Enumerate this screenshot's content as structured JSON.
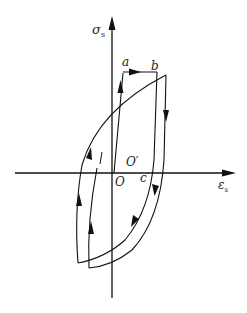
{
  "diagram": {
    "type": "stress-strain hysteresis loop",
    "axes": {
      "y_label": "σ",
      "y_sub": "s",
      "x_label": "ε",
      "x_sub": "s"
    },
    "points": {
      "a": "a",
      "b": "b",
      "c": "c",
      "O": "O",
      "O_prime": "O′"
    },
    "colors": {
      "stroke": "#111111",
      "background": "#ffffff"
    }
  }
}
